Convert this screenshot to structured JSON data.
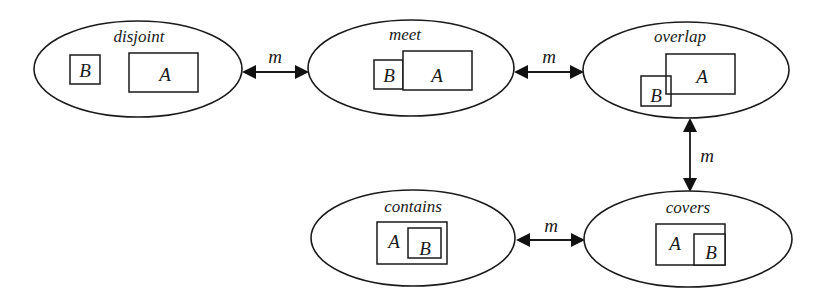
{
  "diagram": {
    "type": "state-transition",
    "colors": {
      "stroke": "#1a1a1a",
      "background": "#ffffff"
    },
    "states": {
      "disjoint": {
        "title": "disjoint",
        "cx": 138,
        "cy": 69,
        "rx": 104,
        "ry": 48,
        "title_x": 139,
        "title_y": 42,
        "boxes": [
          {
            "label": "B",
            "x": 70,
            "y": 55,
            "w": 30,
            "h": 29,
            "lx": 85,
            "ly": 77
          },
          {
            "label": "A",
            "x": 129,
            "y": 53,
            "w": 69,
            "h": 39,
            "lx": 165,
            "ly": 81
          }
        ]
      },
      "meet": {
        "title": "meet",
        "cx": 411,
        "cy": 68,
        "rx": 103,
        "ry": 48,
        "title_x": 405,
        "title_y": 40,
        "boxes": [
          {
            "label": "B",
            "x": 374,
            "y": 60,
            "w": 29,
            "h": 29,
            "lx": 389,
            "ly": 82
          },
          {
            "label": "A",
            "x": 403,
            "y": 51,
            "w": 69,
            "h": 39,
            "lx": 437,
            "ly": 82
          }
        ]
      },
      "overlap": {
        "title": "overlap",
        "cx": 686,
        "cy": 70,
        "rx": 103,
        "ry": 48,
        "title_x": 680,
        "title_y": 42,
        "boxes": [
          {
            "label": "A",
            "x": 666,
            "y": 54,
            "w": 69,
            "h": 40,
            "lx": 702,
            "ly": 83
          },
          {
            "label": "B",
            "x": 641,
            "y": 76,
            "w": 30,
            "h": 30,
            "lx": 656,
            "ly": 102,
            "clear": true
          }
        ]
      },
      "covers": {
        "title": "covers",
        "cx": 688,
        "cy": 239,
        "rx": 104,
        "ry": 48,
        "title_x": 688,
        "title_y": 213,
        "boxes": [
          {
            "label": "A",
            "x": 656,
            "y": 224,
            "w": 69,
            "h": 41,
            "lx": 675,
            "ly": 250
          },
          {
            "label": "B",
            "x": 694,
            "y": 234,
            "w": 31,
            "h": 31,
            "lx": 711,
            "ly": 259
          }
        ]
      },
      "contains": {
        "title": "contains",
        "cx": 413,
        "cy": 238,
        "rx": 102,
        "ry": 48,
        "title_x": 413,
        "title_y": 212,
        "boxes": [
          {
            "label": "A",
            "x": 377,
            "y": 222,
            "w": 70,
            "h": 42,
            "lx": 394,
            "ly": 248
          },
          {
            "label": "B",
            "x": 408,
            "y": 228,
            "w": 33,
            "h": 30,
            "lx": 425,
            "ly": 255
          }
        ]
      }
    },
    "edges": [
      {
        "from": "disjoint",
        "to": "meet",
        "label": "m",
        "x1": 242,
        "y1": 72,
        "x2": 309,
        "y2": 72,
        "lx": 275,
        "ly": 63,
        "orientation": "horizontal"
      },
      {
        "from": "meet",
        "to": "overlap",
        "label": "m",
        "x1": 514,
        "y1": 72,
        "x2": 584,
        "y2": 72,
        "lx": 549,
        "ly": 63,
        "orientation": "horizontal"
      },
      {
        "from": "overlap",
        "to": "covers",
        "label": "m",
        "x1": 690,
        "y1": 118,
        "x2": 690,
        "y2": 192,
        "lx": 707,
        "ly": 162,
        "orientation": "vertical"
      },
      {
        "from": "contains",
        "to": "covers",
        "label": "m",
        "x1": 516,
        "y1": 240,
        "x2": 585,
        "y2": 240,
        "lx": 551,
        "ly": 232,
        "orientation": "horizontal"
      }
    ]
  }
}
